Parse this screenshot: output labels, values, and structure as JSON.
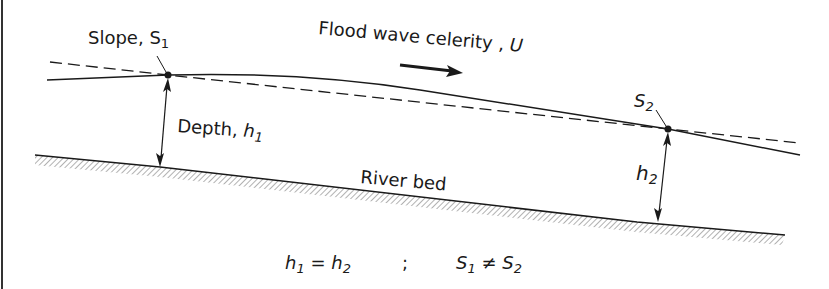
{
  "labels": {
    "slope1": "Slope, S",
    "slope1_sub": "1",
    "celerity": "Flood wave celerity , ",
    "celerity_var": "U",
    "s2": "S",
    "s2_sub": "2",
    "depth1": "Depth, ",
    "depth1_var": "h",
    "depth1_sub": "1",
    "riverbed": "River bed",
    "h2_var": "h",
    "h2_sub": "2"
  },
  "equation": {
    "left_var": "h",
    "left_sub": "1",
    "eq": " = ",
    "right_var": "h",
    "right_sub": "2",
    "sep": ";",
    "s_left": "S",
    "s_left_sub": "1",
    "neq": " ≠ ",
    "s_right": "S",
    "s_right_sub": "2"
  },
  "colors": {
    "line": "#1a1a1a",
    "hatch": "#555555",
    "background": "#ffffff"
  }
}
